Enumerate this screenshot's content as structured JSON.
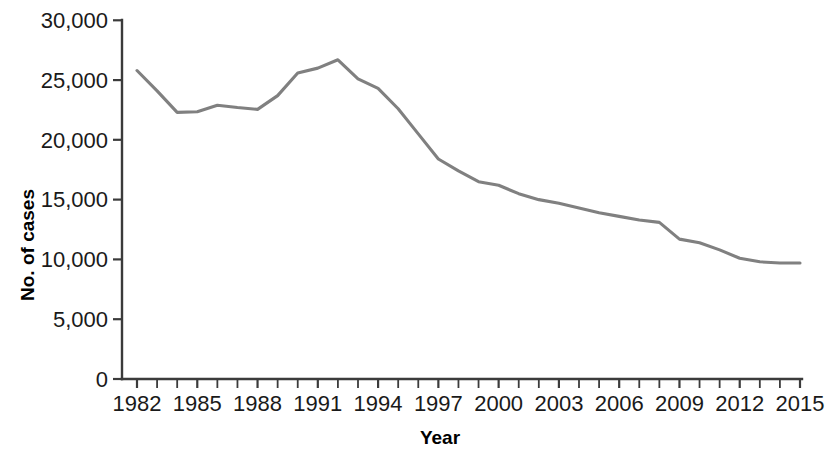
{
  "chart_data": {
    "type": "line",
    "title": "",
    "subtitle": "",
    "xlabel": "Year",
    "ylabel": "No. of cases",
    "grid": false,
    "legend": false,
    "legend_position": "none",
    "line_color": "#808080",
    "axis_color": "#3b3b3b",
    "text_color": "#1a1a1a",
    "background_color": "#ffffff",
    "xlim": [
      1982,
      2015
    ],
    "ylim": [
      0,
      30000
    ],
    "y_ticks": [
      0,
      5000,
      10000,
      15000,
      20000,
      25000,
      30000
    ],
    "y_tick_labels": [
      "0",
      "5,000",
      "10,000",
      "15,000",
      "20,000",
      "25,000",
      "30,000"
    ],
    "x_ticks": [
      1982,
      1983,
      1984,
      1985,
      1986,
      1987,
      1988,
      1989,
      1990,
      1991,
      1992,
      1993,
      1994,
      1995,
      1996,
      1997,
      1998,
      1999,
      2000,
      2001,
      2002,
      2003,
      2004,
      2005,
      2006,
      2007,
      2008,
      2009,
      2010,
      2011,
      2012,
      2013,
      2014,
      2015
    ],
    "x_tick_labels_shown": [
      "1982",
      "1985",
      "1988",
      "1991",
      "1994",
      "1997",
      "2000",
      "2003",
      "2006",
      "2009",
      "2012",
      "2015"
    ],
    "x": [
      1982,
      1983,
      1984,
      1985,
      1986,
      1987,
      1988,
      1989,
      1990,
      1991,
      1992,
      1993,
      1994,
      1995,
      1996,
      1997,
      1998,
      1999,
      2000,
      2001,
      2002,
      2003,
      2004,
      2005,
      2006,
      2007,
      2008,
      2009,
      2010,
      2011,
      2012,
      2013,
      2014,
      2015
    ],
    "values": [
      25800,
      24100,
      22300,
      22350,
      22900,
      22700,
      22550,
      23700,
      25600,
      26000,
      26700,
      25100,
      24300,
      22600,
      20500,
      18400,
      17400,
      16500,
      16200,
      15500,
      15000,
      14700,
      14300,
      13900,
      13600,
      13300,
      13100,
      11700,
      11400,
      10800,
      10100,
      9800,
      9700,
      9700
    ],
    "series": [
      {
        "name": "No. of cases",
        "values": [
          25800,
          24100,
          22300,
          22350,
          22900,
          22700,
          22550,
          23700,
          25600,
          26000,
          26700,
          25100,
          24300,
          22600,
          20500,
          18400,
          17400,
          16500,
          16200,
          15500,
          15000,
          14700,
          14300,
          13900,
          13600,
          13300,
          13100,
          11700,
          11400,
          10800,
          10100,
          9800,
          9700,
          9700
        ]
      }
    ]
  },
  "axes": {
    "y_title": "No. of cases",
    "x_title": "Year"
  }
}
